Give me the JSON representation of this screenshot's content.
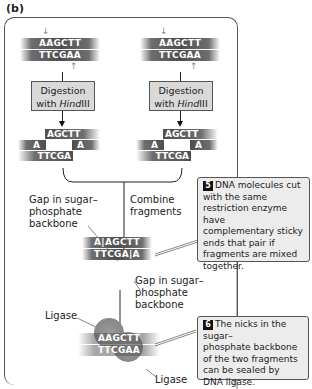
{
  "panel_label": "(b)",
  "left_column": {
    "top_strand": "AAGCTT",
    "bottom_strand": "TTCGAA",
    "process_box": {
      "line1": "Digestion",
      "line2_prefix": "with ",
      "enzyme_italic": "Hind",
      "enzyme_suffix": "III"
    },
    "fragment_top": "AGCTT",
    "fragment_a_left": "A",
    "fragment_a_right": "A",
    "fragment_bottom": "TTCGA"
  },
  "right_column": {
    "top_strand": "AAGCTT",
    "bottom_strand": "TTCGAA",
    "process_box": {
      "line1": "Digestion",
      "line2_prefix": "with ",
      "enzyme_italic": "Hind",
      "enzyme_suffix": "III"
    },
    "fragment_top": "AGCTT",
    "fragment_a_left": "A",
    "fragment_a_right": "A",
    "fragment_bottom": "TTCGA"
  },
  "combine_label": {
    "line1": "Combine",
    "line2": "fragments"
  },
  "gap_label_left": {
    "line1": "Gap in sugar–",
    "line2": "phosphate",
    "line3": "backbone"
  },
  "combined": {
    "top": "A|AGCTT",
    "bottom": "TTCGA|A"
  },
  "gap_label_right": {
    "line1": "Gap in sugar–",
    "line2": "phosphate",
    "line3": "backbone"
  },
  "ligated": {
    "top": "AAGCTT",
    "bottom": "TTCGAA"
  },
  "ligase_label_top": "Ligase",
  "ligase_label_bottom": "Ligase",
  "note5": {
    "badge": "5",
    "lines": [
      "DNA molecules cut",
      "with the same",
      "restriction enzyme have",
      "complementary sticky",
      "ends that pair if",
      "fragments are mixed",
      "together."
    ]
  },
  "note6": {
    "badge": "6",
    "lines": [
      "The nicks in the sugar–",
      "phosphate backbone",
      "of the two fragments",
      "can be sealed by",
      "DNA ligase."
    ]
  },
  "colors": {
    "strand": "#4e4e4e",
    "box_fill": "#d9d9d9",
    "note_fill": "#ececec",
    "ligase": "#8a8a8a"
  }
}
